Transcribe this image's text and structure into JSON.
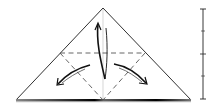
{
  "diagram": {
    "type": "origami-fold-step",
    "colors": {
      "paper": "#ffffff",
      "outline": "#1a1a1a",
      "fold_line": "#555555",
      "centerline": "#bbbbbb",
      "arrow": "#111111"
    },
    "triangle": {
      "apex": [
        103,
        8
      ],
      "left": [
        16,
        100
      ],
      "right": [
        191,
        100
      ]
    },
    "valley_folds": [
      {
        "from": [
          60,
          53
        ],
        "to": [
          145,
          53
        ]
      },
      {
        "from": [
          60,
          53
        ],
        "to": [
          103,
          100
        ]
      },
      {
        "from": [
          145,
          53
        ],
        "to": [
          103,
          100
        ]
      }
    ],
    "arrows": [
      {
        "name": "arrow-up",
        "direction": "up"
      },
      {
        "name": "arrow-left",
        "direction": "down-left"
      },
      {
        "name": "arrow-right",
        "direction": "down-right"
      }
    ],
    "scale_bar": {
      "x": 203,
      "top": 9,
      "bottom": 99,
      "ticks": [
        9,
        31,
        54,
        76,
        99
      ]
    }
  }
}
